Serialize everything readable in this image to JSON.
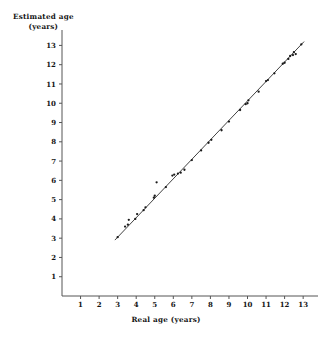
{
  "chart_data": {
    "type": "scatter",
    "title": "",
    "xlabel": "Real age (years)",
    "ylabel_line1": "Estimated age",
    "ylabel_line2": "(years)",
    "xlim": [
      0,
      13.8
    ],
    "ylim": [
      0,
      13.8
    ],
    "xticks": [
      1,
      2,
      3,
      4,
      5,
      6,
      7,
      8,
      9,
      10,
      11,
      12,
      13
    ],
    "yticks": [
      1,
      2,
      3,
      4,
      5,
      6,
      7,
      8,
      9,
      10,
      11,
      12,
      13
    ],
    "grid": false,
    "legend": "none",
    "marker": "dot",
    "marker_color": "#1a1a1a",
    "line_color": "#2b2b2b",
    "axis_color": "#555555",
    "series": [
      {
        "name": "Estimated vs real age",
        "points": [
          [
            3.0,
            3.05
          ],
          [
            3.4,
            3.6
          ],
          [
            3.55,
            3.7
          ],
          [
            3.6,
            3.95
          ],
          [
            3.95,
            4.0
          ],
          [
            4.05,
            4.25
          ],
          [
            4.4,
            4.45
          ],
          [
            4.5,
            4.6
          ],
          [
            4.95,
            5.1
          ],
          [
            5.0,
            5.2
          ],
          [
            5.1,
            5.9
          ],
          [
            5.6,
            5.65
          ],
          [
            5.95,
            6.25
          ],
          [
            6.05,
            6.3
          ],
          [
            6.25,
            6.35
          ],
          [
            6.4,
            6.4
          ],
          [
            6.6,
            6.55
          ],
          [
            7.0,
            7.05
          ],
          [
            7.5,
            7.55
          ],
          [
            7.9,
            7.95
          ],
          [
            8.05,
            8.1
          ],
          [
            8.6,
            8.6
          ],
          [
            9.0,
            9.05
          ],
          [
            9.6,
            9.65
          ],
          [
            9.9,
            9.95
          ],
          [
            10.0,
            10.0
          ],
          [
            10.05,
            10.15
          ],
          [
            10.6,
            10.6
          ],
          [
            11.0,
            11.15
          ],
          [
            11.1,
            11.2
          ],
          [
            11.45,
            11.55
          ],
          [
            11.9,
            12.05
          ],
          [
            12.0,
            12.1
          ],
          [
            12.2,
            12.3
          ],
          [
            12.3,
            12.45
          ],
          [
            12.45,
            12.5
          ],
          [
            12.5,
            12.65
          ],
          [
            12.6,
            12.55
          ],
          [
            12.9,
            13.05
          ]
        ]
      }
    ],
    "fit_line": {
      "name": "regression line",
      "x_start": 2.85,
      "y_start": 2.9,
      "x_end": 13.05,
      "y_end": 13.2
    }
  }
}
